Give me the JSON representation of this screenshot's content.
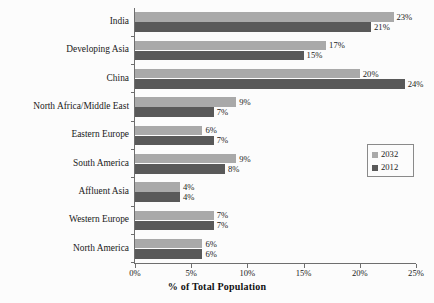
{
  "chart_data": {
    "type": "bar",
    "orientation": "horizontal",
    "title": "",
    "xlabel": "% of Total Population",
    "ylabel": "",
    "xlim": [
      0,
      25
    ],
    "xticks": [
      "0%",
      "5%",
      "10%",
      "15%",
      "20%",
      "25%"
    ],
    "xtick_values": [
      0,
      5,
      10,
      15,
      20,
      25
    ],
    "grid": false,
    "legend_position": "center-right",
    "categories": [
      "India",
      "Developing Asia",
      "China",
      "North Africa/Middle East",
      "Eastern Europe",
      "South America",
      "Affluent Asia",
      "Western Europe",
      "North America"
    ],
    "series": [
      {
        "name": "2032",
        "color": "#a9a9a9",
        "values": [
          23,
          17,
          20,
          9,
          6,
          9,
          4,
          7,
          6
        ],
        "labels": [
          "23%",
          "17%",
          "20%",
          "9%",
          "6%",
          "9%",
          "4%",
          "7%",
          "6%"
        ]
      },
      {
        "name": "2012",
        "color": "#595959",
        "values": [
          21,
          15,
          24,
          7,
          7,
          8,
          4,
          7,
          6
        ],
        "labels": [
          "21%",
          "15%",
          "24%",
          "7%",
          "7%",
          "8%",
          "4%",
          "7%",
          "6%"
        ]
      }
    ]
  },
  "legend": {
    "items": [
      {
        "label": "2032",
        "color": "#a9a9a9"
      },
      {
        "label": "2012",
        "color": "#595959"
      }
    ]
  },
  "axis": {
    "x_title": "% of Total Population"
  }
}
